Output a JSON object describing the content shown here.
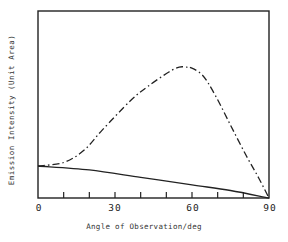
{
  "chart_data": {
    "type": "line",
    "title": "",
    "xlabel": "Angle of Observation/deg",
    "ylabel": "Emission Intensity (Unit Area)",
    "xlim": [
      0,
      90
    ],
    "ylim": [
      0,
      1
    ],
    "x_ticks": [
      0,
      10,
      20,
      30,
      40,
      50,
      60,
      70,
      80,
      90
    ],
    "x_tick_labels": [
      "0",
      "30",
      "60",
      "90"
    ],
    "x_tick_label_positions": [
      0,
      30,
      60,
      90
    ],
    "y_ticks": [],
    "grid": false,
    "legend": null,
    "series": [
      {
        "name": "dash-dot curve",
        "style": "dash-dot",
        "color": "#222222",
        "x": [
          0,
          10,
          18,
          25,
          36,
          43,
          51,
          55,
          58,
          59,
          64,
          69,
          75,
          81,
          86,
          90
        ],
        "values": [
          0.171,
          0.19,
          0.256,
          0.363,
          0.52,
          0.599,
          0.674,
          0.7,
          0.7,
          0.7,
          0.658,
          0.551,
          0.39,
          0.23,
          0.107,
          0.0
        ]
      },
      {
        "name": "solid curve",
        "style": "solid",
        "color": "#222222",
        "x": [
          0,
          20,
          40,
          60,
          75,
          90
        ],
        "values": [
          0.171,
          0.15,
          0.11,
          0.07,
          0.04,
          0.0
        ]
      }
    ]
  },
  "labels": {
    "xlabel": "Angle of Observation/deg",
    "ylabel": "Emission Intensity (Unit Area)",
    "ticks": [
      "0",
      "30",
      "60",
      "90"
    ]
  }
}
